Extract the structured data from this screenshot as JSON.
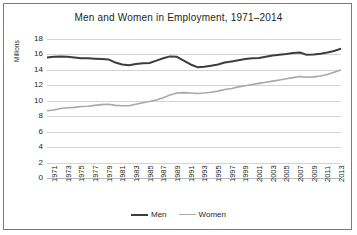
{
  "chart_data": {
    "type": "line",
    "title": "Men and Women in Employment, 1971–2014",
    "xlabel": "",
    "ylabel": "Millions",
    "ylim": [
      0,
      18
    ],
    "ytick_values": [
      0,
      2,
      4,
      6,
      8,
      10,
      12,
      14,
      16,
      18
    ],
    "grid": true,
    "legend_position": "bottom",
    "x": [
      1971,
      1972,
      1973,
      1974,
      1975,
      1976,
      1977,
      1978,
      1979,
      1980,
      1981,
      1982,
      1983,
      1984,
      1985,
      1986,
      1987,
      1988,
      1989,
      1990,
      1991,
      1992,
      1993,
      1994,
      1995,
      1996,
      1997,
      1998,
      1999,
      2000,
      2001,
      2002,
      2003,
      2004,
      2005,
      2006,
      2007,
      2008,
      2009,
      2010,
      2011,
      2012,
      2013,
      2014
    ],
    "xtick_labels": [
      "1971",
      "1973",
      "1975",
      "1977",
      "1979",
      "1981",
      "1983",
      "1985",
      "1987",
      "1989",
      "1991",
      "1993",
      "1995",
      "1997",
      "1999",
      "2001",
      "2003",
      "2005",
      "2007",
      "2009",
      "2011",
      "2013"
    ],
    "series": [
      {
        "name": "Men",
        "color": "#3d3d3d",
        "width": 2.0,
        "values": [
          15.6,
          15.7,
          15.75,
          15.7,
          15.6,
          15.5,
          15.5,
          15.45,
          15.4,
          15.35,
          14.95,
          14.7,
          14.6,
          14.75,
          14.85,
          14.9,
          15.2,
          15.5,
          15.75,
          15.7,
          15.2,
          14.7,
          14.35,
          14.4,
          14.55,
          14.7,
          14.95,
          15.1,
          15.25,
          15.4,
          15.5,
          15.55,
          15.7,
          15.85,
          15.95,
          16.05,
          16.2,
          16.25,
          15.95,
          16.0,
          16.1,
          16.25,
          16.45,
          16.75
        ]
      },
      {
        "name": "Women",
        "color": "#a8a8a8",
        "width": 1.6,
        "values": [
          8.7,
          8.8,
          9.0,
          9.1,
          9.15,
          9.25,
          9.3,
          9.4,
          9.5,
          9.55,
          9.4,
          9.35,
          9.35,
          9.55,
          9.75,
          9.9,
          10.1,
          10.4,
          10.75,
          11.0,
          11.05,
          11.0,
          10.95,
          11.0,
          11.1,
          11.25,
          11.45,
          11.6,
          11.8,
          11.95,
          12.1,
          12.25,
          12.4,
          12.55,
          12.7,
          12.85,
          13.0,
          13.15,
          13.05,
          13.1,
          13.2,
          13.4,
          13.7,
          14.0
        ]
      }
    ]
  },
  "legend": {
    "items": [
      {
        "label": "Men"
      },
      {
        "label": "Women"
      }
    ]
  }
}
